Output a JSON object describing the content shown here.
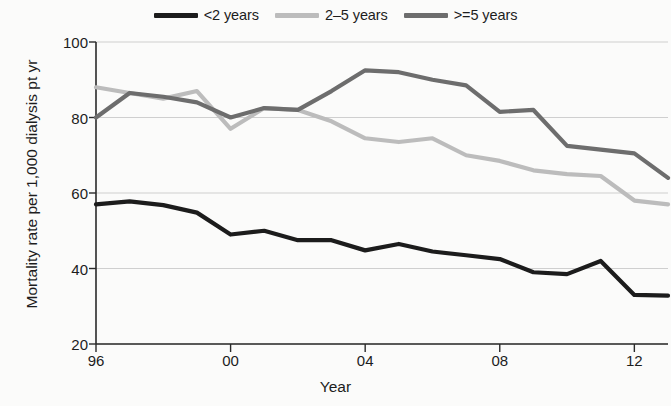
{
  "chart_data": {
    "type": "line",
    "title": "",
    "xlabel": "Year",
    "ylabel": "Mortality rate per 1,000 dialysis pt yr",
    "xlim": [
      1996,
      2013
    ],
    "ylim": [
      20,
      100
    ],
    "yticks": [
      20,
      40,
      60,
      80,
      100
    ],
    "ytick_labels": [
      "20",
      "40",
      "60",
      "80",
      "100"
    ],
    "xticks": [
      1996,
      2000,
      2004,
      2008,
      2012
    ],
    "xtick_labels": [
      "96",
      "00",
      "04",
      "08",
      "12"
    ],
    "grid": "horizontal",
    "legend_position": "top-center",
    "x": [
      1996,
      1997,
      1998,
      1999,
      2000,
      2001,
      2002,
      2003,
      2004,
      2005,
      2006,
      2007,
      2008,
      2009,
      2010,
      2011,
      2012,
      2013
    ],
    "series": [
      {
        "name": "<2 years",
        "color": "#1c1c1c",
        "values": [
          57,
          57.8,
          56.8,
          54.8,
          49,
          50,
          47.5,
          47.5,
          44.8,
          46.5,
          44.5,
          43.5,
          42.5,
          39,
          38.5,
          42,
          33,
          32.8
        ]
      },
      {
        "name": "2–5 years",
        "color": "#bcbcbc",
        "values": [
          88,
          86.5,
          85,
          87,
          77,
          82.5,
          82,
          79,
          74.5,
          73.5,
          74.5,
          70,
          68.5,
          66,
          65,
          64.5,
          58,
          57
        ]
      },
      {
        "name": ">=5 years",
        "color": "#6d6d6d",
        "values": [
          80,
          86.5,
          85.5,
          84,
          80,
          82.5,
          82,
          87,
          92.5,
          92,
          90,
          88.5,
          81.5,
          82,
          72.5,
          71.5,
          70.5,
          64
        ]
      }
    ]
  },
  "legend": {
    "items": [
      {
        "label": "<2 years",
        "color": "#1c1c1c"
      },
      {
        "label": "2–5 years",
        "color": "#bcbcbc"
      },
      {
        "label": ">=5 years",
        "color": "#6d6d6d"
      }
    ]
  }
}
